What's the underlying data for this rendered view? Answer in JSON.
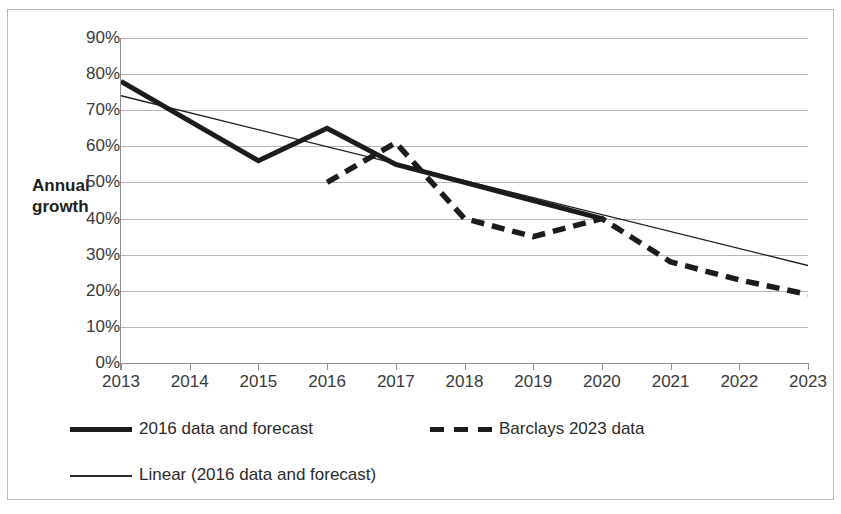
{
  "chart_data": {
    "type": "line",
    "title": "",
    "xlabel": "",
    "ylabel": "Annual growth",
    "categories": [
      "2013",
      "2014",
      "2015",
      "2016",
      "2017",
      "2018",
      "2019",
      "2020",
      "2021",
      "2022",
      "2023"
    ],
    "ylim": [
      0,
      90
    ],
    "ytick_labels": [
      "90%",
      "80%",
      "70%",
      "60%",
      "50%",
      "40%",
      "30%",
      "20%",
      "10%",
      "0%"
    ],
    "ytick_values": [
      90,
      80,
      70,
      60,
      50,
      40,
      30,
      20,
      10,
      0
    ],
    "grid": true,
    "legend_position": "bottom",
    "series": [
      {
        "name": "2016 data and forecast",
        "style": "solid-thick",
        "x": [
          "2013",
          "2014",
          "2015",
          "2016",
          "2017",
          "2018",
          "2019",
          "2020"
        ],
        "values": [
          78,
          67,
          56,
          65,
          55,
          50,
          45,
          40
        ]
      },
      {
        "name": "Barclays 2023 data",
        "style": "dashed-thick",
        "x": [
          "2016",
          "2017",
          "2018",
          "2019",
          "2020",
          "2021",
          "2022",
          "2023"
        ],
        "values": [
          50,
          61,
          40,
          35,
          40,
          28,
          23,
          19
        ]
      },
      {
        "name": "Linear (2016 data and forecast)",
        "style": "thin-solid",
        "x": [
          "2013",
          "2023"
        ],
        "values": [
          74,
          27
        ]
      }
    ]
  },
  "axis": {
    "y_label_line1": "Annual",
    "y_label_line2": "growth"
  },
  "legend": {
    "items": [
      {
        "label": "2016 data and forecast",
        "marker": "solid-thick-line-icon"
      },
      {
        "label": "Barclays 2023 data",
        "marker": "dashed-line-icon"
      },
      {
        "label": "Linear (2016 data and forecast)",
        "marker": "thin-line-icon"
      }
    ]
  },
  "colors": {
    "series_ink": "#1c1c1c",
    "gridline": "#b6b6b6",
    "axis": "#8f8f8f",
    "border": "#b9b9b9",
    "background": "#ffffff"
  }
}
